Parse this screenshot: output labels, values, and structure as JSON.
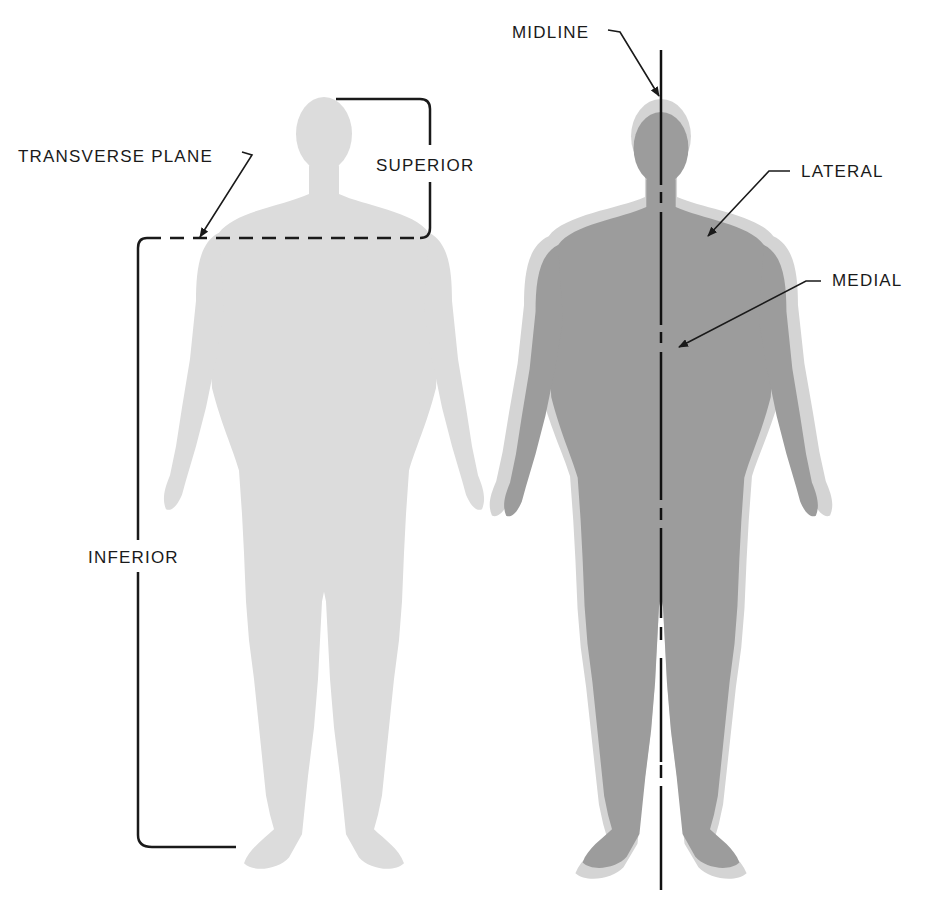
{
  "diagram": {
    "colors": {
      "background": "#ffffff",
      "figure_light": "#dcdcdc",
      "figure_dark": "#9c9c9c",
      "figure_outline": "#d4d4d4",
      "line": "#1a1a1a"
    },
    "left_figure": {
      "labels": {
        "transverse_plane": "TRANSVERSE PLANE",
        "superior": "SUPERIOR",
        "inferior": "INFERIOR"
      }
    },
    "right_figure": {
      "labels": {
        "midline": "MIDLINE",
        "lateral": "LATERAL",
        "medial": "MEDIAL"
      }
    }
  }
}
